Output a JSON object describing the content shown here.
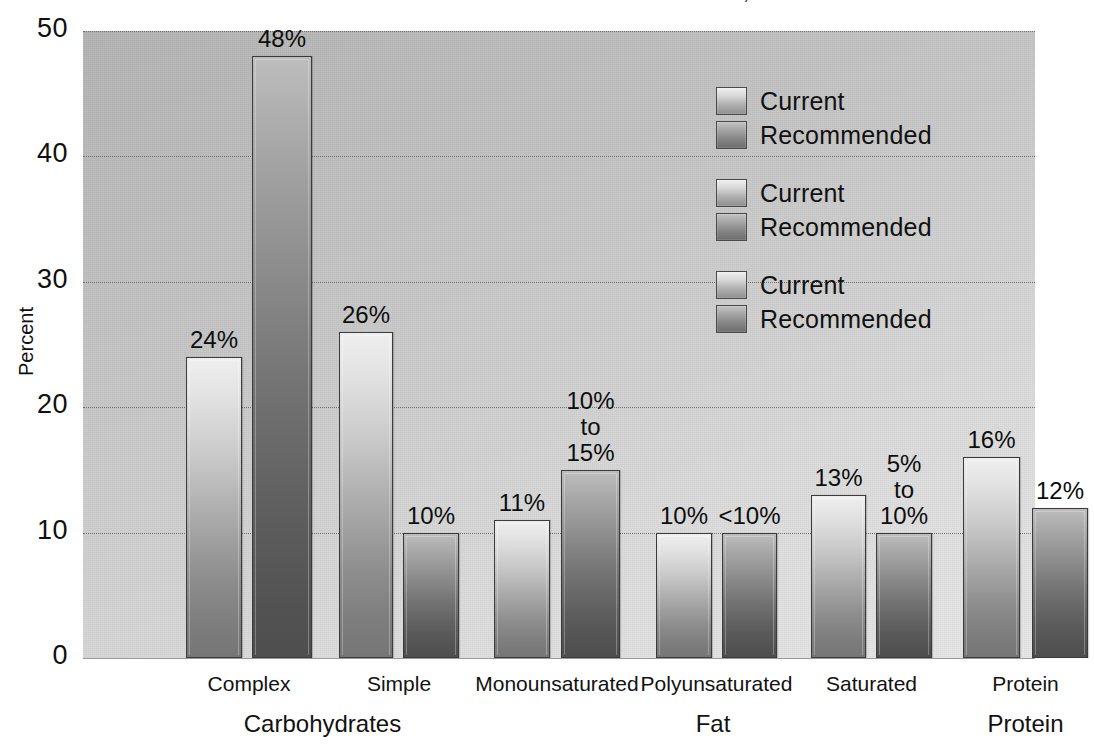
{
  "title_fragment": ")",
  "chart_data": {
    "type": "bar",
    "title": "",
    "xlabel": "",
    "ylabel": "Percent",
    "ylim": [
      0,
      50
    ],
    "yticks": [
      0,
      10,
      20,
      30,
      40,
      50
    ],
    "grid": true,
    "legend_position": "upper right",
    "categories": [
      "Complex",
      "Simple",
      "Monounsaturated",
      "Polyunsaturated",
      "Saturated",
      "Protein"
    ],
    "group_labels": [
      "Carbohydrates",
      "Fat",
      "Protein"
    ],
    "series": [
      {
        "name": "Current",
        "values": [
          24,
          26,
          11,
          10,
          13,
          16
        ],
        "labels": [
          "24%",
          "26%",
          "11%",
          "10%",
          "13%",
          "16%"
        ]
      },
      {
        "name": "Recommended",
        "values": [
          48,
          10,
          15,
          10,
          10,
          12
        ],
        "labels": [
          "48%",
          "10%",
          "10%\nto\n15%",
          "<10%",
          "5%\nto\n10%",
          "12%"
        ]
      }
    ],
    "bars": [
      {
        "label": "24%",
        "value": 24,
        "series": "Current",
        "category": "Complex",
        "style": "light",
        "x": 103,
        "w": 56
      },
      {
        "label": "48%",
        "value": 48,
        "series": "Recommended",
        "category": "Complex",
        "style": "dark",
        "x": 169,
        "w": 60
      },
      {
        "label": "26%",
        "value": 26,
        "series": "Current",
        "category": "Simple",
        "style": "light",
        "x": 256,
        "w": 54
      },
      {
        "label": "10%",
        "value": 10,
        "series": "Recommended",
        "category": "Simple",
        "style": "dark",
        "x": 320,
        "w": 56
      },
      {
        "label": "11%",
        "value": 11,
        "series": "Current",
        "category": "Monounsaturated",
        "style": "light",
        "x": 411,
        "w": 56
      },
      {
        "label": "10%\nto\n15%",
        "value": 15,
        "series": "Recommended",
        "category": "Monounsaturated",
        "style": "dark",
        "x": 478,
        "w": 59
      },
      {
        "label": "10%",
        "value": 10,
        "series": "Current",
        "category": "Polyunsaturated",
        "style": "light",
        "x": 573,
        "w": 56
      },
      {
        "label": "<10%",
        "value": 10,
        "series": "Recommended",
        "category": "Polyunsaturated",
        "style": "dark",
        "x": 639,
        "w": 55
      },
      {
        "label": "13%",
        "value": 13,
        "series": "Current",
        "category": "Saturated",
        "style": "light",
        "x": 728,
        "w": 55
      },
      {
        "label": "5%\nto\n10%",
        "value": 10,
        "series": "Recommended",
        "category": "Saturated",
        "style": "dark",
        "x": 793,
        "w": 56
      },
      {
        "label": "16%",
        "value": 16,
        "series": "Current",
        "category": "Protein",
        "style": "light",
        "x": 880,
        "w": 57
      },
      {
        "label": "12%",
        "value": 12,
        "series": "Recommended",
        "category": "Protein",
        "style": "dark",
        "x": 949,
        "w": 56
      }
    ],
    "legend_entries": [
      {
        "label": "Current",
        "style": "light"
      },
      {
        "label": "Recommended",
        "style": "dark"
      },
      {
        "label": "Current",
        "style": "light"
      },
      {
        "label": "Recommended",
        "style": "dark"
      },
      {
        "label": "Current",
        "style": "light"
      },
      {
        "label": "Recommended",
        "style": "dark"
      }
    ],
    "colors": {
      "bar_light_top": "#efefef",
      "bar_light_bottom": "#767676",
      "bar_dark_top": "#bdbdbd",
      "bar_dark_bottom": "#4e4e4e",
      "bar_border": "#3b3b3b",
      "plot_background": "#c9c9c9",
      "gridline": "#5f5f5f",
      "text": "#111111"
    }
  }
}
